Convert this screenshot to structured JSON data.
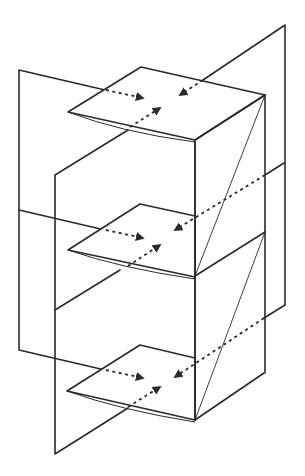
{
  "diagram": {
    "title": "",
    "colors": {
      "line": "#2a2a2a",
      "background": "#ffffff"
    },
    "levels": [
      {
        "id": "top",
        "dy": 0
      },
      {
        "id": "middle",
        "dy": 137
      },
      {
        "id": "bottom",
        "dy": 278
      }
    ],
    "arrow_count_per_level": 3,
    "labels": []
  }
}
